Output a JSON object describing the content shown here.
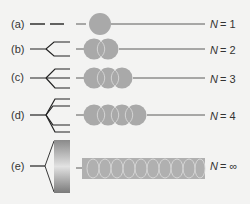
{
  "diagram": {
    "colors": {
      "background": "#f3f3f2",
      "line": "#222222",
      "atom": "#a9a9a9",
      "overlap_edge": "#d8d8d8"
    },
    "rows": [
      {
        "label": "(a)",
        "n_label": "N = 1",
        "n_var": "N",
        "n_value": "= 1",
        "atoms": 1
      },
      {
        "label": "(b)",
        "n_label": "N = 2",
        "n_var": "N",
        "n_value": "= 2",
        "atoms": 2
      },
      {
        "label": "(c)",
        "n_label": "N = 3",
        "n_var": "N",
        "n_value": "= 3",
        "atoms": 3
      },
      {
        "label": "(d)",
        "n_label": "N = 4",
        "n_var": "N",
        "n_value": "= 4",
        "atoms": 4
      },
      {
        "label": "(e)",
        "n_label": "N = ∞",
        "n_var": "N",
        "n_value": "= ∞",
        "atoms": "band"
      }
    ]
  }
}
